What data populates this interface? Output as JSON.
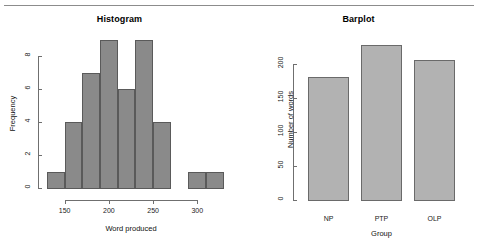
{
  "figure": {
    "panels": [
      {
        "id": "histogram",
        "title": "Histogram"
      },
      {
        "id": "barplot",
        "title": "Barplot"
      }
    ]
  },
  "chart_data": [
    {
      "type": "bar",
      "subtype": "histogram",
      "title": "Histogram",
      "xlabel": "Word produced",
      "ylabel": "Frequency",
      "xlim": [
        130,
        320
      ],
      "ylim": [
        0,
        9
      ],
      "grid": false,
      "legend": null,
      "bin_width": 20,
      "bin_edges": [
        130,
        150,
        170,
        190,
        210,
        230,
        250,
        270,
        290,
        310,
        320
      ],
      "bin_starts": [
        130,
        150,
        170,
        190,
        210,
        230,
        250,
        290,
        310
      ],
      "values": [
        1,
        4,
        7,
        9,
        6,
        9,
        4,
        1,
        1
      ],
      "xticks": [
        150,
        200,
        250,
        300
      ],
      "xtick_labels": [
        "150",
        "200",
        "250",
        "300"
      ],
      "yticks": [
        0,
        2,
        4,
        6,
        8
      ],
      "ytick_labels": [
        "0",
        "2",
        "4",
        "6",
        "8"
      ],
      "bar_color": "#8a8a8a",
      "bar_border_color": "#5a5a5a"
    },
    {
      "type": "bar",
      "subtype": "barplot",
      "title": "Barplot",
      "xlabel": "Group",
      "ylabel": "Number of words",
      "categories": [
        "NP",
        "PTP",
        "OLP"
      ],
      "values": [
        181,
        228,
        205
      ],
      "ylim": [
        0,
        235
      ],
      "grid": false,
      "legend": null,
      "yticks": [
        0,
        50,
        100,
        150,
        200
      ],
      "ytick_labels": [
        "0",
        "50",
        "100",
        "150",
        "200"
      ],
      "bar_color": "#b2b2b2",
      "bar_border_color": "#6a6a6a"
    }
  ]
}
